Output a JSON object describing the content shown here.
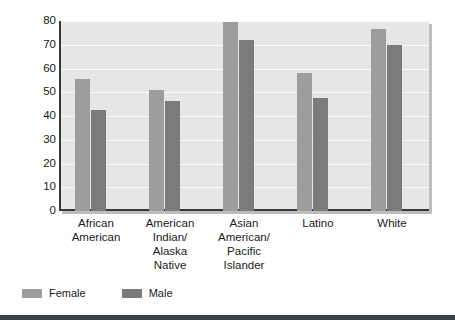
{
  "chart_data": {
    "type": "bar",
    "title": "",
    "xlabel": "",
    "ylabel": "Percentage",
    "ylim": [
      0,
      80
    ],
    "yticks": [
      0,
      10,
      20,
      30,
      40,
      50,
      60,
      70,
      80
    ],
    "grid": true,
    "legend_position": "bottom-left",
    "categories": [
      "African American",
      "American Indian/ Alaska Native",
      "Asian American/ Pacific Islander",
      "Latino",
      "White"
    ],
    "category_lines": [
      [
        "African",
        "American"
      ],
      [
        "American",
        "Indian/",
        "Alaska",
        "Native"
      ],
      [
        "Asian",
        "American/",
        "Pacific",
        "Islander"
      ],
      [
        "Latino"
      ],
      [
        "White"
      ]
    ],
    "series": [
      {
        "name": "Female",
        "color": "#9d9d9d",
        "values": [
          55.5,
          51,
          79.5,
          58,
          76.5
        ]
      },
      {
        "name": "Male",
        "color": "#7b7b7b",
        "values": [
          42.5,
          46.5,
          72,
          47.5,
          70
        ]
      }
    ]
  },
  "legend": {
    "items": [
      {
        "label": "Female",
        "swatch": "female"
      },
      {
        "label": "Male",
        "swatch": "male"
      }
    ]
  },
  "colors": {
    "female_bar": "#9d9d9d",
    "male_bar": "#7b7b7b",
    "plot_background": "#e6e6e6",
    "axis": "#3a3a3a",
    "gridline": "#fcfcfc",
    "footer_bar": "#3c3f44",
    "text": "#1a1a1a"
  }
}
